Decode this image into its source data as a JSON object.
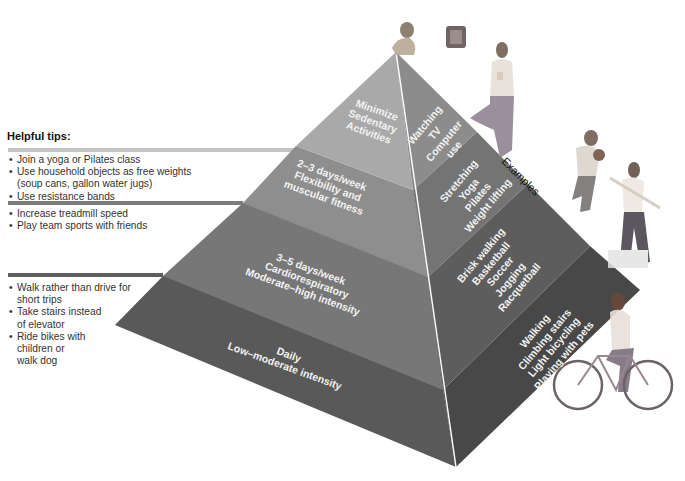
{
  "tips": {
    "title": "Helpful tips:",
    "groups": [
      {
        "level": "flexibility",
        "bar_color": "#bdbdbd",
        "items": [
          "Join a yoga or Pilates class",
          "Use household objects as free weights (soup cans, gallon water jugs)",
          "Use resistance bands"
        ]
      },
      {
        "level": "cardio",
        "bar_color": "#7a7a7a",
        "items": [
          "Increase treadmill speed",
          "Play team sports with friends"
        ]
      },
      {
        "level": "daily",
        "bar_color": "#5e5e5e",
        "items": [
          "Walk rather than drive for short trips",
          "Take stairs instead of elevator",
          "Ride bikes with children or walk dog"
        ]
      }
    ],
    "lines": {
      "g1": [
        "• Join a yoga or Pilates class",
        "• Use household objects as free weights",
        "  (soup cans, gallon water jugs)",
        "• Use resistance bands"
      ],
      "g2": [
        "• Increase treadmill speed",
        "• Play team sports with friends"
      ],
      "g3": [
        "• Walk rather than drive for",
        "  short trips",
        "• Take stairs instead",
        "  of elevator",
        "• Ride bikes with",
        "  children or",
        "  walk dog"
      ]
    }
  },
  "pyramid": {
    "levels": [
      {
        "name": "Minimize Sedentary Activities",
        "line1": "Minimize",
        "line2": "Sedentary",
        "line3": "Activities",
        "left_color": "#a8a8a8",
        "right_color": "#8e8e8e",
        "examples": [
          "Watching",
          "TV",
          "Computer",
          "use"
        ]
      },
      {
        "name": "2–3 days/week Flexibility and muscular fitness",
        "line1": "2–3 days/week",
        "line2": "Flexibility and",
        "line3": "muscular fitness",
        "left_color": "#8f8f8f",
        "right_color": "#767676",
        "examples": [
          "Stretching",
          "Yoga",
          "Pilates",
          "Weight lifting"
        ]
      },
      {
        "name": "3–5 days/week Cardiorespiratory Moderate–high intensity",
        "line1": "3–5 days/week",
        "line2": "Cardiorespiratory",
        "line3": "Moderate–high intensity",
        "left_color": "#777777",
        "right_color": "#5f5f5f",
        "examples": [
          "Brisk walking",
          "Basketball",
          "Soccer",
          "Jogging",
          "Racquetball"
        ]
      },
      {
        "name": "Daily Low–moderate intensity",
        "line1": "Daily",
        "line2": "Low–moderate intensity",
        "left_color": "#5c5c5c",
        "right_color": "#4a4a4a",
        "examples": [
          "Walking",
          "Climbing stairs",
          "Light bicycling",
          "Playing with pets"
        ]
      }
    ],
    "examples_label": "Examples"
  },
  "figures": [
    "person-watching-tv",
    "woman-yoga-tree-pose",
    "man-running-basketball",
    "woman-stretching-band",
    "woman-on-bicycle"
  ]
}
